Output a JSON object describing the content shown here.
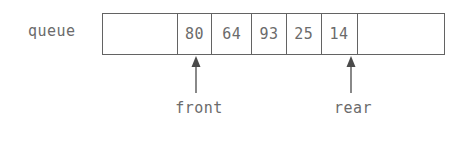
{
  "diagram": {
    "type": "queue-array-diagram",
    "label": "queue",
    "line_color": "#636363",
    "text_color": "#6b6b6b",
    "background": "#ffffff",
    "cells": [
      {
        "value": "",
        "empty": true,
        "width": 75
      },
      {
        "value": "80",
        "empty": false,
        "width": 35
      },
      {
        "value": "64",
        "empty": false,
        "width": 40
      },
      {
        "value": "93",
        "empty": false,
        "width": 35
      },
      {
        "value": "25",
        "empty": false,
        "width": 35
      },
      {
        "value": "14",
        "empty": false,
        "width": 36
      },
      {
        "value": "",
        "empty": true,
        "width": 87
      }
    ],
    "pointers": [
      {
        "label": "front",
        "cell_index": 1,
        "x": 196,
        "label_x": 199,
        "label_y": 99,
        "arrow_top": 57,
        "arrow_bottom": 93
      },
      {
        "label": "rear",
        "cell_index": 5,
        "x": 351,
        "label_x": 353,
        "label_y": 99,
        "arrow_top": 57,
        "arrow_bottom": 93
      }
    ]
  }
}
